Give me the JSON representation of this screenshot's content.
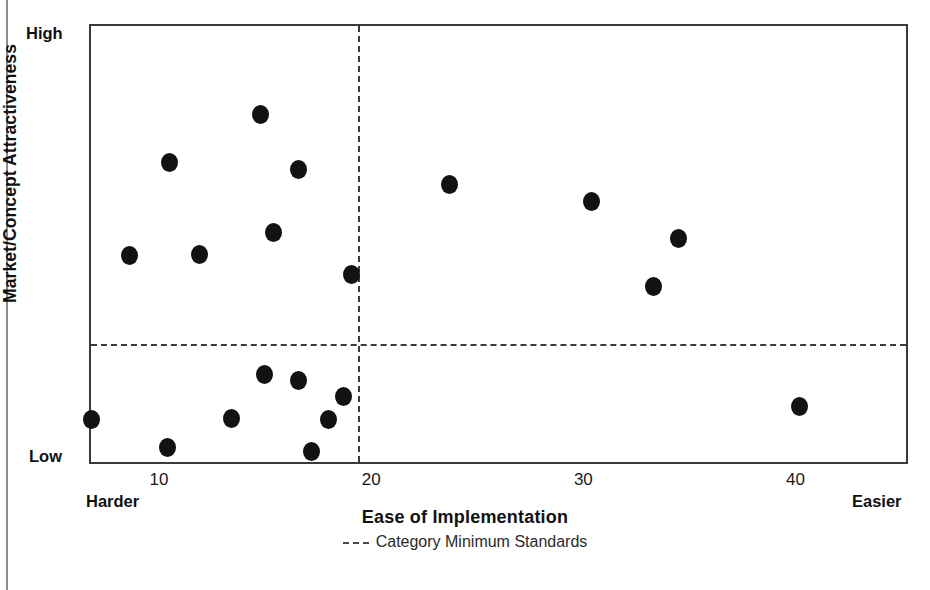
{
  "chart_data": {
    "type": "scatter",
    "title": "",
    "xlabel": "Ease of Implementation",
    "ylabel": "Market/Concept Attractiveness",
    "xlim": [
      6.7,
      45.3
    ],
    "ylim": [
      0,
      100
    ],
    "grid": false,
    "x_tick_labels": [
      "10",
      "20",
      "30",
      "40"
    ],
    "x_ticks": [
      10,
      20,
      30,
      40
    ],
    "x_axis_end_labels": {
      "left": "Harder",
      "right": "Easier"
    },
    "y_axis_end_labels": {
      "top": "High",
      "bottom": "Low"
    },
    "y_tick_labels": [],
    "legend": {
      "position": "below-axis-center",
      "entries": [
        {
          "label": "Category Minimum Standards",
          "style": "dotted-line",
          "color": "#4a4a4a"
        }
      ]
    },
    "annotations": [
      {
        "kind": "vline",
        "name": "category-minimum-standards-vertical",
        "x": 19.3,
        "style": "dotted"
      },
      {
        "kind": "hline",
        "name": "category-minimum-standards-horizontal",
        "y": 27.7,
        "style": "dotted"
      }
    ],
    "marker": {
      "shape": "circle",
      "color": "#121212",
      "size": 17
    },
    "series": [
      {
        "name": "Concepts",
        "points": [
          {
            "x": 14.7,
            "y": 80.0
          },
          {
            "x": 10.4,
            "y": 68.9
          },
          {
            "x": 16.5,
            "y": 67.5
          },
          {
            "x": 15.3,
            "y": 53.0
          },
          {
            "x": 11.8,
            "y": 48.0
          },
          {
            "x": 8.5,
            "y": 47.9
          },
          {
            "x": 19.0,
            "y": 43.6
          },
          {
            "x": 23.6,
            "y": 63.9
          },
          {
            "x": 30.3,
            "y": 60.2
          },
          {
            "x": 34.4,
            "y": 51.8
          },
          {
            "x": 33.2,
            "y": 40.7
          },
          {
            "x": 40.1,
            "y": 13.6
          },
          {
            "x": 14.9,
            "y": 20.7
          },
          {
            "x": 16.5,
            "y": 19.5
          },
          {
            "x": 18.6,
            "y": 15.9
          },
          {
            "x": 17.9,
            "y": 10.5
          },
          {
            "x": 13.3,
            "y": 10.7
          },
          {
            "x": 6.7,
            "y": 10.5
          },
          {
            "x": 10.3,
            "y": 4.3
          },
          {
            "x": 17.1,
            "y": 3.2
          }
        ]
      }
    ]
  },
  "figure": {
    "frame": {
      "x_px": 89,
      "y_px": 24,
      "w_px": 819,
      "h_px": 440
    },
    "axis_colors": {
      "frame": "#3a3a3a",
      "dashed": "#3b3b3b",
      "marker": "#121212"
    }
  }
}
